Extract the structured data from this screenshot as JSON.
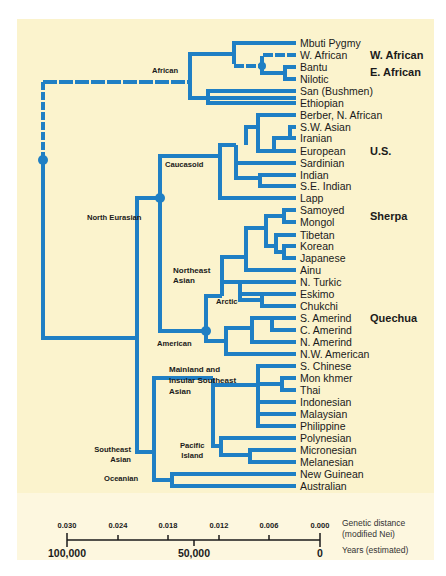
{
  "colors": {
    "branch": "#1f7fc4",
    "panel_bg": "#fbf3cd",
    "scale_bg": "#fdf7df",
    "text": "#1a1a1a"
  },
  "tree": {
    "leaves": [
      "Mbuti Pygmy",
      "W. African",
      "Bantu",
      "Nilotic",
      "San (Bushmen)",
      "Ethiopian",
      "Berber, N. African",
      "S.W. Asian",
      "Iranian",
      "European",
      "Sardinian",
      "Indian",
      "S.E. Indian",
      "Lapp",
      "Samoyed",
      "Mongol",
      "Tibetan",
      "Korean",
      "Japanese",
      "Ainu",
      "N. Turkic",
      "Eskimo",
      "Chukchi",
      "S. Amerind",
      "C. Amerind",
      "N. Amerind",
      "N.W. American",
      "S. Chinese",
      "Mon khmer",
      "Thai",
      "Indonesian",
      "Malaysian",
      "Philippine",
      "Polynesian",
      "Micronesian",
      "Melanesian",
      "New Guinean",
      "Australian"
    ],
    "clades": {
      "african": "African",
      "north_eurasian": "North Eurasian",
      "caucasoid": "Caucasoid",
      "northeast_asian_1": "Northeast",
      "northeast_asian_2": "Asian",
      "arctic": "Arctic",
      "american": "American",
      "mainland_1": "Mainland and",
      "mainland_2": "Insular Southeast",
      "mainland_3": "Asian",
      "pacific_1": "Pacific",
      "pacific_2": "Island",
      "southeast_1": "Southeast",
      "southeast_2": "Asian",
      "oceanian": "Oceanian"
    },
    "populations_studied": [
      {
        "label": "W. African",
        "row": 1
      },
      {
        "label": "E. African",
        "row": 3
      },
      {
        "label": "U.S.",
        "row": 9
      },
      {
        "label": "Sherpa",
        "row": 15
      },
      {
        "label": "Quechua",
        "row": 23
      }
    ]
  },
  "scale": {
    "genetic_distance_ticks": [
      "0.030",
      "0.024",
      "0.018",
      "0.012",
      "0.006",
      "0.000"
    ],
    "years_ticks": [
      "100,000",
      "50,000",
      "0"
    ],
    "genetic_distance_label_1": "Genetic distance",
    "genetic_distance_label_2": "(modified Nei)",
    "years_label": "Years (estimated)"
  }
}
